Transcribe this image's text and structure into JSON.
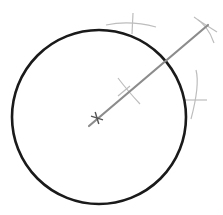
{
  "diagram": {
    "colors": {
      "background": "#ffffff",
      "circle": "#1a1a1a",
      "line": "#8c8c8c",
      "construction": "#bdbdbd"
    },
    "circle": {
      "cx": 99,
      "cy": 117,
      "r": 87,
      "stroke_width": 2.6
    },
    "center_mark": {
      "x": 97,
      "y": 118,
      "size": 6
    },
    "radial_line": {
      "x1": 89,
      "y1": 126,
      "x2": 208,
      "y2": 25,
      "stroke_width": 2.2
    },
    "construction_marks": [
      {
        "name": "top-arc",
        "path": "M106 25 Q130 20 156 27",
        "tick": "M133 13 L132 34"
      },
      {
        "name": "mid-arc",
        "path": "M118 78 Q127 90 140 104",
        "tick": "M118 96 L130 86"
      },
      {
        "name": "right-arc",
        "path": "M196 70 Q200 85 191 119",
        "tick": "M184 100 L207 100"
      },
      {
        "name": "end-arc",
        "path": "M194 17 Q208 25 214 43",
        "tick": "M198 20 L217 32"
      }
    ]
  }
}
